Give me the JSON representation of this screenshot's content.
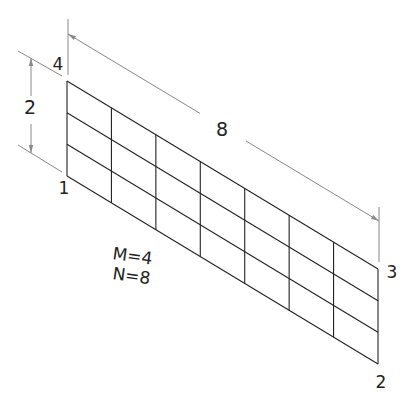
{
  "diagram": {
    "mesh": {
      "M": 4,
      "N": 8,
      "corner_4": [
        67,
        81
      ],
      "corner_1": [
        67,
        176
      ],
      "corner_3": [
        378,
        269
      ],
      "corner_2": [
        378,
        364
      ],
      "line_color": "#222222"
    },
    "corner_labels": [
      {
        "id": "4",
        "text": "4",
        "x": 58,
        "y": 70
      },
      {
        "id": "1",
        "text": "1",
        "x": 64,
        "y": 194
      },
      {
        "id": "3",
        "text": "3",
        "x": 392,
        "y": 278
      },
      {
        "id": "2",
        "text": "2",
        "x": 381,
        "y": 388
      }
    ],
    "dimensions": {
      "height": {
        "label": "2",
        "x": 31,
        "y1": 58,
        "y2": 153,
        "label_x": 30,
        "label_y": 114
      },
      "length": {
        "label": "8",
        "x1": 68,
        "y1": 34,
        "x2": 379,
        "y2": 221,
        "label_x": 222,
        "label_y": 136
      }
    },
    "params_text": {
      "m_line": "M=4",
      "n_line": "N=8"
    },
    "dim_color": "#888888"
  }
}
